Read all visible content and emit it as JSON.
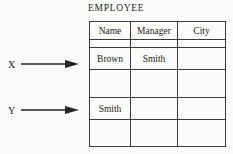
{
  "title": "EMPLOYEE",
  "table": {
    "columns": [
      "Name",
      "Manager",
      "City"
    ],
    "rows": [
      [
        "",
        "",
        ""
      ],
      [
        "Brown",
        "Smith",
        ""
      ],
      [
        "",
        "",
        ""
      ],
      [
        "Smith",
        "",
        ""
      ],
      [
        "",
        "",
        ""
      ]
    ]
  },
  "pointers": [
    {
      "label": "X",
      "points_to": "Brown"
    },
    {
      "label": "Y",
      "points_to": "Smith"
    }
  ],
  "colors": {
    "background": "#fbfbf9",
    "line": "#3a3a3a",
    "text": "#1d1d1d"
  }
}
